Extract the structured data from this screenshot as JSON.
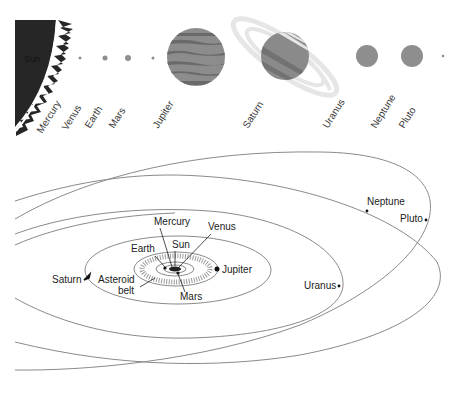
{
  "top_panel": {
    "sun_label": "Sun",
    "planet_labels": [
      "Mercury",
      "Venus",
      "Earth",
      "Mars",
      "Jupiter",
      "Saturn",
      "Uranus",
      "Neptune",
      "Pluto"
    ],
    "colors": {
      "sun": "#262626",
      "planet_gray": "#8e8e8e",
      "jupiter_dark": "#6f6f6f",
      "ring": "#e4e4e4"
    }
  },
  "orbit_panel": {
    "labels": {
      "mercury": "Mercury",
      "venus": "Venus",
      "earth": "Earth",
      "sun": "Sun",
      "mars": "Mars",
      "jupiter": "Jupiter",
      "saturn": "Saturn",
      "asteroid_line1": "Asteroid",
      "asteroid_line2": "belt",
      "uranus": "Uranus",
      "neptune": "Neptune",
      "pluto": "Pluto"
    },
    "colors": {
      "orbit": "#8a8a8a",
      "text": "#222222"
    }
  }
}
